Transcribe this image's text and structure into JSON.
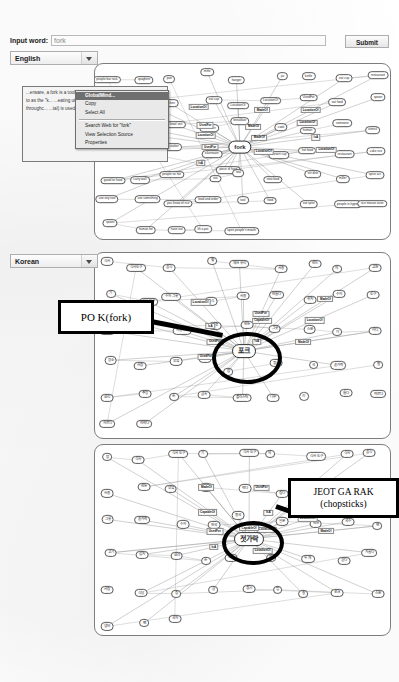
{
  "toolbar": {
    "input_label": "Input word:",
    "input_value": "fork",
    "input_placeholder": "fork",
    "submit_label": "Submit"
  },
  "language_selects": [
    {
      "name": "english",
      "value": "English"
    },
    {
      "name": "korean",
      "value": "Korean"
    }
  ],
  "context_menu": {
    "background_text": "...erware, a fork is a tool consisting of a ha... ...nes (usually t... ...d to as the \"k... ...eating utensil... ...s were more p... ...lable throughc... ...tal) is used to lift food to the mouth or...",
    "selected_word": "fork",
    "items": [
      {
        "label": "GlobalMind...",
        "selected": true
      },
      {
        "label": "Copy",
        "selected": false
      },
      {
        "label": "Select All",
        "selected": false
      },
      {
        "separator": true
      },
      {
        "label": "Search Web for \"fork\"",
        "selected": false
      },
      {
        "label": "View Selection Source",
        "selected": false
      },
      {
        "label": "Properties",
        "selected": false
      }
    ]
  },
  "annotations": [
    {
      "name": "po-k-callout",
      "line1": "PO K(fork)",
      "line2": ""
    },
    {
      "name": "jeot-ga-rak-callout",
      "line1": "JEOT GA RAK",
      "line2": "(chopsticks)"
    }
  ],
  "graphs": [
    {
      "name": "english-graph",
      "language": "English",
      "center_node": "fork",
      "nodes": [
        "people bar rock",
        "spaghetti",
        "pan",
        "mitte",
        "hanger",
        "jar",
        "kettle",
        "eat cup",
        "restaurant",
        "eat",
        "silver",
        "kitchen",
        "eat cup",
        "LocationOf",
        "LocationOf",
        "UsedFor",
        "eat food",
        "spoon",
        "knife",
        "scale",
        "eat bowl unit",
        "container",
        "breakfast",
        "cook",
        "human",
        "someone",
        "utensil",
        "kitchen restaurant",
        "eat plate",
        "rice cooker",
        "silverware",
        "piece of food",
        "desert cup",
        "hot food",
        "restaurant",
        "cake rice",
        "good for food",
        "carry wall",
        "people so hot",
        "eat",
        "tool",
        "new food",
        "stir dish",
        "miller",
        "spice act",
        "use any tool",
        "use something",
        "you know of rice",
        "food and order",
        "tool",
        "food",
        "eat spite",
        "people in hyper",
        "rice mouse oven",
        "spoon",
        "human be",
        "have eat",
        "lift a pot",
        "open people's mouth"
      ],
      "relations": [
        "LocationOf",
        "MadeOf",
        "LocationOf",
        "UsedFor",
        "MadeOf",
        "LocationOf",
        "LocationOf",
        "MadeOf",
        "IsA",
        "UsedFor",
        "LocationOf",
        "LocationOf",
        "IsA"
      ]
    },
    {
      "name": "korean-graph-fork",
      "language": "Korean",
      "center_node": "포크",
      "circled_node": "포크",
      "nodes": [
        "식사",
        "식사 도구",
        "음식",
        "쩢",
        "채쓰 유리",
        "사용",
        "만드",
        "의",
        "교환",
        "기",
        "식사 도구",
        "수저 그릇",
        "음식",
        "사용",
        "만들다",
        "위치",
        "수저",
        "도구",
        "젓가락",
        "먹다",
        "사용하다",
        "으로",
        "만든",
        "그릇",
        "스푼",
        "이",
        "어디",
        "장소",
        "사람",
        "부엌",
        "식당",
        "밥",
        "접시",
        "국",
        "숟가락",
        "칼",
        "요리",
        "주방",
        "손",
        "금속",
        "플라스틱",
        "나무",
        "쇠",
        "들다",
        "찌르다",
        "자르다",
        "떠먹다"
      ],
      "relations": [
        "LocationOf",
        "UsedFor",
        "MadeOf",
        "IsA",
        "CapableOf",
        "LocationOf",
        "UsedFor",
        "IsA",
        "MadeOf",
        "UsedFor"
      ]
    },
    {
      "name": "korean-graph-chopsticks",
      "language": "Korean",
      "center_node": "젓가락",
      "circled_node": "젓가락",
      "center_relation": "CapableOf",
      "nodes": [
        "밥",
        "식사",
        "식사 도구",
        "기",
        "식사 도구",
        "의",
        "식사 도구",
        "식사",
        "음식",
        "사용",
        "만든",
        "부엌",
        "식탁",
        "먹다",
        "집다",
        "나무",
        "쇠",
        "플라스틱",
        "그릇",
        "숟가락",
        "수저",
        "한국",
        "중국",
        "일본",
        "반찬",
        "국수",
        "면",
        "고기",
        "김치",
        "요리",
        "손",
        "도구",
        "짝",
        "두 개",
        "길다",
        "가늘다",
        "사람",
        "식당",
        "집",
        "상",
        "접시",
        "컵",
        "칼",
        "포크",
        "스푼",
        "냄비",
        "팬",
        "국자"
      ],
      "relations": [
        "MadeOf",
        "UsedFor",
        "LocationOf",
        "CapableOf",
        "IsA",
        "LocationOf",
        "UsedFor",
        "LocationOf",
        "MadeOf",
        "IsA",
        "LocationOf"
      ]
    }
  ]
}
